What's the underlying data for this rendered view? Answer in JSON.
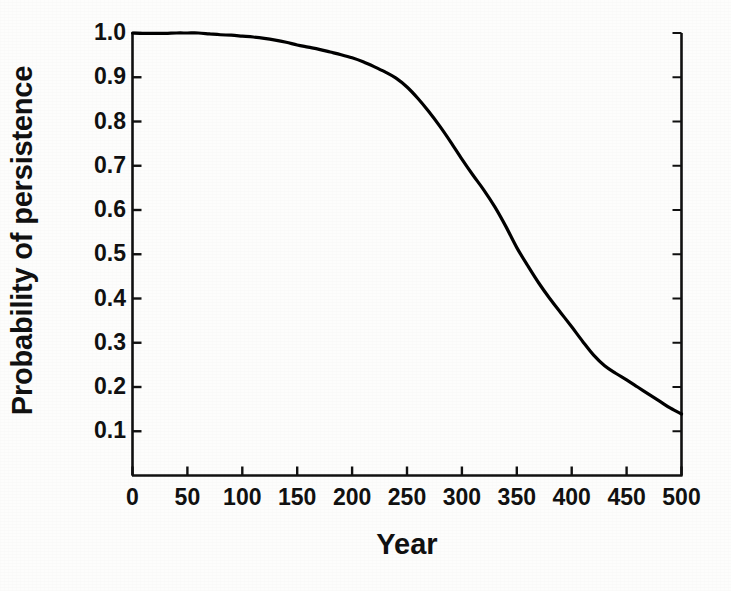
{
  "chart_data": {
    "type": "line",
    "title": "",
    "xlabel": "Year",
    "ylabel": "Probability of persistence",
    "xlim": [
      0,
      500
    ],
    "ylim": [
      0.0,
      1.0
    ],
    "xticks": [
      0,
      50,
      100,
      150,
      200,
      250,
      300,
      350,
      400,
      450,
      500
    ],
    "xtick_labels": [
      "0",
      "50",
      "100",
      "150",
      "200",
      "250",
      "300",
      "350",
      "400",
      "450",
      "500"
    ],
    "yticks": [
      0.1,
      0.2,
      0.3,
      0.4,
      0.5,
      0.6,
      0.7,
      0.8,
      0.9,
      1.0
    ],
    "ytick_labels": [
      "0.1",
      "0.2",
      "0.3",
      "0.4",
      "0.5",
      "0.6",
      "0.7",
      "0.8",
      "0.9",
      "1.0"
    ],
    "grid": false,
    "legend": false,
    "line_color": "#000000",
    "line_width": 3.2,
    "series": [
      {
        "name": "Probability of persistence",
        "x": [
          0,
          10,
          20,
          30,
          40,
          50,
          60,
          70,
          80,
          90,
          100,
          110,
          120,
          130,
          140,
          150,
          160,
          170,
          180,
          190,
          200,
          210,
          220,
          230,
          240,
          250,
          260,
          270,
          280,
          290,
          300,
          310,
          320,
          330,
          340,
          350,
          360,
          370,
          380,
          390,
          400,
          410,
          420,
          430,
          440,
          450,
          460,
          470,
          480,
          490,
          500
        ],
        "y": [
          1.0,
          0.999,
          0.999,
          0.999,
          1.0,
          1.0,
          1.0,
          0.998,
          0.996,
          0.995,
          0.993,
          0.991,
          0.988,
          0.984,
          0.979,
          0.973,
          0.968,
          0.963,
          0.957,
          0.951,
          0.944,
          0.935,
          0.924,
          0.912,
          0.898,
          0.878,
          0.852,
          0.822,
          0.789,
          0.753,
          0.715,
          0.679,
          0.645,
          0.607,
          0.563,
          0.515,
          0.474,
          0.435,
          0.4,
          0.368,
          0.336,
          0.303,
          0.272,
          0.248,
          0.231,
          0.216,
          0.2,
          0.184,
          0.168,
          0.152,
          0.139
        ]
      }
    ]
  },
  "axis": {
    "ylabel_text": "Probability of persistence",
    "xlabel_text": "Year"
  }
}
